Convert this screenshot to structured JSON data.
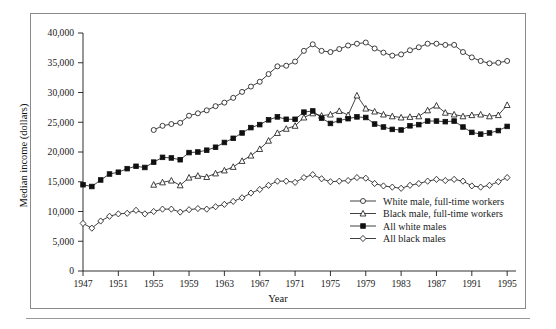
{
  "figure": {
    "ylabel": "Median income (dollars)",
    "xlabel": "Year"
  },
  "chart_data": {
    "type": "line",
    "title": "",
    "xlabel": "Year",
    "ylabel": "Median income (dollars)",
    "xlim": [
      1947,
      1996
    ],
    "ylim": [
      0,
      40000
    ],
    "ytick_labels": [
      "0",
      "5,000",
      "10,000",
      "15,000",
      "20,000",
      "25,000",
      "30,000",
      "35,000",
      "40,000"
    ],
    "yticks": [
      0,
      5000,
      10000,
      15000,
      20000,
      25000,
      30000,
      35000,
      40000
    ],
    "xticks": [
      1947,
      1951,
      1955,
      1959,
      1963,
      1967,
      1971,
      1975,
      1979,
      1983,
      1987,
      1991,
      1995
    ],
    "xtick_labels": [
      "1947",
      "1951",
      "1955",
      "1959",
      "1963",
      "1967",
      "1971",
      "1975",
      "1979",
      "1983",
      "1987",
      "1991",
      "1995"
    ],
    "grid": false,
    "legend_position": "lower right",
    "series": [
      {
        "name": "White male, full-time workers",
        "marker": "open-circle",
        "x": [
          1955,
          1956,
          1957,
          1958,
          1959,
          1960,
          1961,
          1962,
          1963,
          1964,
          1965,
          1966,
          1967,
          1968,
          1969,
          1970,
          1971,
          1972,
          1973,
          1974,
          1975,
          1976,
          1977,
          1978,
          1979,
          1980,
          1981,
          1982,
          1983,
          1984,
          1985,
          1986,
          1987,
          1988,
          1989,
          1990,
          1991,
          1992,
          1993,
          1994,
          1995
        ],
        "values": [
          23700,
          24400,
          24700,
          24900,
          26100,
          26500,
          27000,
          27700,
          28300,
          29100,
          30100,
          31000,
          31800,
          33100,
          34400,
          34500,
          35200,
          37000,
          38100,
          37000,
          36800,
          37300,
          37900,
          38200,
          38400,
          37400,
          36700,
          36200,
          36400,
          37100,
          37600,
          38200,
          38200,
          38000,
          38000,
          36800,
          35900,
          35300,
          34900,
          35000,
          35300
        ]
      },
      {
        "name": "Black male, full-time workers",
        "marker": "open-triangle",
        "x": [
          1955,
          1956,
          1957,
          1958,
          1959,
          1960,
          1961,
          1962,
          1963,
          1964,
          1965,
          1966,
          1967,
          1968,
          1969,
          1970,
          1971,
          1972,
          1973,
          1974,
          1975,
          1976,
          1977,
          1978,
          1979,
          1980,
          1981,
          1982,
          1983,
          1984,
          1985,
          1986,
          1987,
          1988,
          1989,
          1990,
          1991,
          1992,
          1993,
          1994,
          1995
        ],
        "values": [
          14500,
          14900,
          15200,
          14400,
          15700,
          16000,
          15800,
          16400,
          16900,
          17500,
          18500,
          19400,
          20500,
          21900,
          23200,
          23900,
          24400,
          25800,
          26500,
          26100,
          26300,
          26900,
          26200,
          29500,
          27300,
          26800,
          26300,
          26000,
          25800,
          25900,
          26000,
          27000,
          27800,
          26600,
          26300,
          26000,
          26200,
          26300,
          26000,
          26200,
          27900
        ]
      },
      {
        "name": "All white males",
        "marker": "filled-square",
        "x": [
          1947,
          1948,
          1949,
          1950,
          1951,
          1952,
          1953,
          1954,
          1955,
          1956,
          1957,
          1958,
          1959,
          1960,
          1961,
          1962,
          1963,
          1964,
          1965,
          1966,
          1967,
          1968,
          1969,
          1970,
          1971,
          1972,
          1973,
          1974,
          1975,
          1976,
          1977,
          1978,
          1979,
          1980,
          1981,
          1982,
          1983,
          1984,
          1985,
          1986,
          1987,
          1988,
          1989,
          1990,
          1991,
          1992,
          1993,
          1994,
          1995
        ],
        "values": [
          14500,
          14200,
          15300,
          16300,
          16600,
          17200,
          17600,
          17400,
          18300,
          19100,
          19000,
          18700,
          19900,
          20000,
          20300,
          20800,
          21600,
          22300,
          23200,
          24100,
          24600,
          25400,
          25900,
          25500,
          25500,
          26700,
          26900,
          25700,
          24800,
          25300,
          25600,
          25900,
          25800,
          24700,
          24200,
          23800,
          23700,
          24400,
          24600,
          25200,
          25200,
          25100,
          25200,
          24200,
          23300,
          23000,
          23200,
          23600,
          24300
        ]
      },
      {
        "name": "All black males",
        "marker": "open-diamond",
        "x": [
          1947,
          1948,
          1949,
          1950,
          1951,
          1952,
          1953,
          1954,
          1955,
          1956,
          1957,
          1958,
          1959,
          1960,
          1961,
          1962,
          1963,
          1964,
          1965,
          1966,
          1967,
          1968,
          1969,
          1970,
          1971,
          1972,
          1973,
          1974,
          1975,
          1976,
          1977,
          1978,
          1979,
          1980,
          1981,
          1982,
          1983,
          1984,
          1985,
          1986,
          1987,
          1988,
          1989,
          1990,
          1991,
          1992,
          1993,
          1994,
          1995
        ],
        "values": [
          8000,
          7200,
          8400,
          9200,
          9600,
          9700,
          10200,
          9600,
          10000,
          10400,
          10400,
          9900,
          10300,
          10500,
          10400,
          10800,
          11200,
          11700,
          12300,
          13100,
          13700,
          14400,
          15100,
          15100,
          14900,
          15700,
          16200,
          15500,
          15000,
          15100,
          15200,
          15700,
          15600,
          14700,
          14300,
          14100,
          13900,
          14400,
          14700,
          15100,
          15400,
          15200,
          15400,
          15100,
          14300,
          14100,
          14400,
          15000,
          15700
        ]
      }
    ]
  },
  "legend": {
    "entries": [
      {
        "label": "White male, full-time workers",
        "marker": "open-circle"
      },
      {
        "label": "Black male, full-time workers",
        "marker": "open-triangle"
      },
      {
        "label": "All white males",
        "marker": "filled-square"
      },
      {
        "label": "All black males",
        "marker": "open-diamond"
      }
    ]
  }
}
